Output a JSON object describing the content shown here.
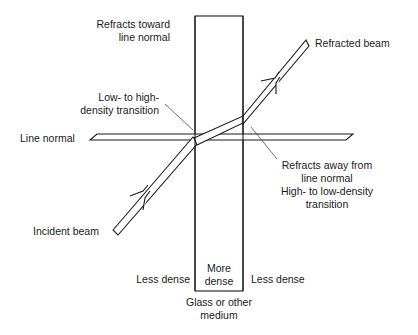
{
  "colors": {
    "stroke": "#1a1a1a",
    "background": "#ffffff",
    "text": "#1a1a1a"
  },
  "labels": {
    "refracts_toward": [
      "Refracts toward",
      "line normal"
    ],
    "low_to_high": [
      "Low- to high-",
      "density transition"
    ],
    "line_normal": "Line normal",
    "refracted_beam": "Refracted beam",
    "refracts_away": [
      "Refracts away from",
      "line normal",
      "High- to low-density",
      "transition"
    ],
    "incident_beam": "Incident beam",
    "less_dense_left": "Less dense",
    "more_dense": [
      "More",
      "dense"
    ],
    "less_dense_right": "Less dense",
    "medium": [
      "Glass or other",
      "medium"
    ]
  },
  "elements": {
    "medium_block": {
      "x": 195,
      "y": 16,
      "width": 48,
      "height": 275
    },
    "line_normal": {
      "x1": 90,
      "x2": 353,
      "y_top": 134,
      "y_bottom": 140
    },
    "incident_beam": {
      "from": [
        115,
        232
      ],
      "to": [
        196,
        140
      ],
      "direction": "up-right"
    },
    "internal_beam": {
      "from": [
        196,
        140
      ],
      "to": [
        243,
        120
      ]
    },
    "refracted_beam": {
      "from": [
        243,
        120
      ],
      "to": [
        307,
        43
      ],
      "direction": "up-right"
    }
  }
}
